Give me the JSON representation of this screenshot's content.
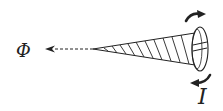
{
  "diagram": {
    "labels": {
      "flux": "Φ",
      "current": "I"
    },
    "elements": [
      {
        "name": "screw",
        "description": "tapered screw with slotted head pointing left"
      },
      {
        "name": "flux-arrow",
        "description": "dashed arrow pointing left from screw tip",
        "style": "dashed"
      },
      {
        "name": "rotation-arrow-top",
        "description": "curved arrow above screw head, clockwise"
      },
      {
        "name": "rotation-arrow-bottom",
        "description": "curved arrow below screw head, clockwise"
      }
    ],
    "colors": {
      "ink": "#222222",
      "background": "#ffffff"
    }
  }
}
